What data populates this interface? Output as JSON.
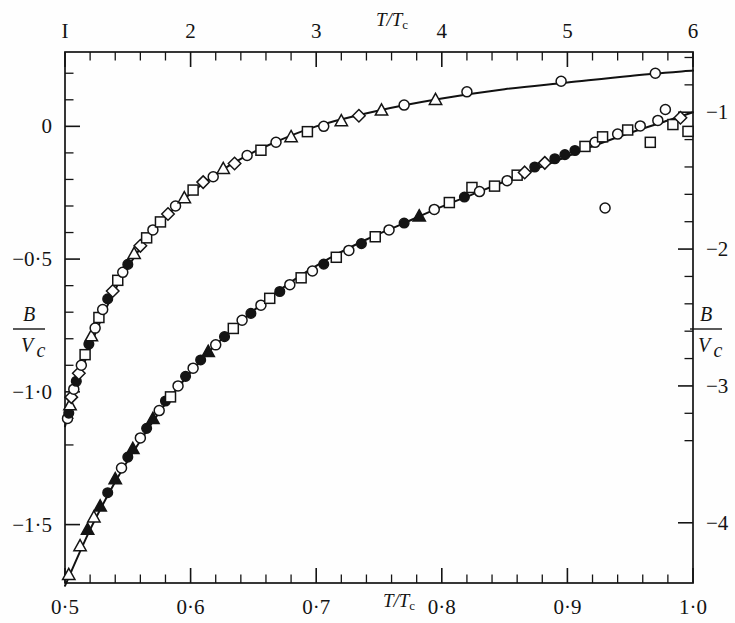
{
  "figure": {
    "background": "#fefefe",
    "ink": "#141414",
    "curve_color": "#111111"
  },
  "chart_data": {
    "type": "scatter",
    "title": "",
    "subtitle": "",
    "grid": false,
    "legend": "none",
    "axes": {
      "top": {
        "name": "top-axis",
        "label": "T/Tc",
        "label_numerator": "T",
        "label_denominator": "T",
        "label_subscript": "c",
        "ticks": [
          "I",
          "2",
          "3",
          "4",
          "5",
          "6"
        ],
        "tick_values": [
          1,
          2,
          3,
          4,
          5,
          6
        ],
        "range": [
          1,
          6
        ],
        "minor_per_major": 5
      },
      "bottom": {
        "name": "bottom-axis",
        "label": "T/Tc",
        "label_numerator": "T",
        "label_denominator": "T",
        "label_subscript": "c",
        "ticks": [
          "0·5",
          "0·6",
          "0·7",
          "0·8",
          "0·9",
          "1·0"
        ],
        "tick_values": [
          0.5,
          0.6,
          0.7,
          0.8,
          0.9,
          1.0
        ],
        "range": [
          0.5,
          1.0
        ],
        "minor_per_major": 5
      },
      "left": {
        "name": "left-axis",
        "label": "B/Vc",
        "label_numerator": "B",
        "label_denominator": "V",
        "label_subscript": "c",
        "ticks": [
          "0",
          "−0·5",
          "−1·0",
          "−1·5"
        ],
        "tick_values": [
          0,
          -0.5,
          -1.0,
          -1.5
        ],
        "range": [
          0.28,
          -1.72
        ],
        "minor_per_major": 5
      },
      "right": {
        "name": "right-axis",
        "label": "B/Vc",
        "label_numerator": "B",
        "label_denominator": "V",
        "label_subscript": "c",
        "ticks": [
          "−1",
          "−2",
          "−3",
          "−4"
        ],
        "tick_values": [
          -1,
          -2,
          -3,
          -4
        ],
        "range": [
          -0.56,
          -4.44
        ],
        "minor_per_major": 5
      }
    },
    "series": [
      {
        "name": "upper-curve-high-temperature-branch",
        "axis_x": "top",
        "axis_y": "left",
        "line": true,
        "points": [
          {
            "x": 1.02,
            "y": -1.1,
            "marker": "circle-open"
          },
          {
            "x": 1.03,
            "y": -1.08,
            "marker": "circle-filled"
          },
          {
            "x": 1.04,
            "y": -1.05,
            "marker": "triangle-open"
          },
          {
            "x": 1.05,
            "y": -1.02,
            "marker": "diamond-open"
          },
          {
            "x": 1.07,
            "y": -0.99,
            "marker": "circle-open"
          },
          {
            "x": 1.09,
            "y": -0.96,
            "marker": "circle-filled"
          },
          {
            "x": 1.11,
            "y": -0.93,
            "marker": "diamond-open"
          },
          {
            "x": 1.13,
            "y": -0.9,
            "marker": "circle-open"
          },
          {
            "x": 1.16,
            "y": -0.86,
            "marker": "square-open"
          },
          {
            "x": 1.19,
            "y": -0.82,
            "marker": "circle-filled"
          },
          {
            "x": 1.21,
            "y": -0.79,
            "marker": "triangle-open"
          },
          {
            "x": 1.24,
            "y": -0.76,
            "marker": "circle-open"
          },
          {
            "x": 1.27,
            "y": -0.72,
            "marker": "square-open"
          },
          {
            "x": 1.3,
            "y": -0.69,
            "marker": "circle-open"
          },
          {
            "x": 1.34,
            "y": -0.65,
            "marker": "circle-filled"
          },
          {
            "x": 1.38,
            "y": -0.62,
            "marker": "diamond-open"
          },
          {
            "x": 1.42,
            "y": -0.58,
            "marker": "square-open"
          },
          {
            "x": 1.46,
            "y": -0.55,
            "marker": "circle-open"
          },
          {
            "x": 1.5,
            "y": -0.52,
            "marker": "circle-filled"
          },
          {
            "x": 1.55,
            "y": -0.48,
            "marker": "triangle-open"
          },
          {
            "x": 1.6,
            "y": -0.45,
            "marker": "diamond-open"
          },
          {
            "x": 1.65,
            "y": -0.42,
            "marker": "square-open"
          },
          {
            "x": 1.7,
            "y": -0.39,
            "marker": "circle-open"
          },
          {
            "x": 1.76,
            "y": -0.36,
            "marker": "square-open"
          },
          {
            "x": 1.82,
            "y": -0.33,
            "marker": "diamond-open"
          },
          {
            "x": 1.88,
            "y": -0.3,
            "marker": "circle-open"
          },
          {
            "x": 1.95,
            "y": -0.27,
            "marker": "triangle-open"
          },
          {
            "x": 2.02,
            "y": -0.24,
            "marker": "square-open"
          },
          {
            "x": 2.1,
            "y": -0.21,
            "marker": "diamond-open"
          },
          {
            "x": 2.18,
            "y": -0.19,
            "marker": "circle-open"
          },
          {
            "x": 2.26,
            "y": -0.16,
            "marker": "triangle-open"
          },
          {
            "x": 2.35,
            "y": -0.14,
            "marker": "diamond-open"
          },
          {
            "x": 2.45,
            "y": -0.11,
            "marker": "circle-open"
          },
          {
            "x": 2.56,
            "y": -0.09,
            "marker": "square-open"
          },
          {
            "x": 2.68,
            "y": -0.06,
            "marker": "circle-open"
          },
          {
            "x": 2.8,
            "y": -0.04,
            "marker": "triangle-open"
          },
          {
            "x": 2.93,
            "y": -0.02,
            "marker": "square-open"
          },
          {
            "x": 3.06,
            "y": 0.0,
            "marker": "circle-open"
          },
          {
            "x": 3.2,
            "y": 0.02,
            "marker": "triangle-open"
          },
          {
            "x": 3.34,
            "y": 0.04,
            "marker": "diamond-open"
          },
          {
            "x": 3.52,
            "y": 0.06,
            "marker": "triangle-open"
          },
          {
            "x": 3.7,
            "y": 0.08,
            "marker": "circle-open"
          },
          {
            "x": 3.95,
            "y": 0.1,
            "marker": "triangle-open"
          },
          {
            "x": 4.2,
            "y": 0.13,
            "marker": "circle-open"
          },
          {
            "x": 4.95,
            "y": 0.17,
            "marker": "circle-open"
          },
          {
            "x": 5.7,
            "y": 0.2,
            "marker": "circle-open"
          }
        ]
      },
      {
        "name": "lower-curve-low-temperature-branch",
        "axis_x": "bottom",
        "axis_y": "right",
        "line": true,
        "points": [
          {
            "x": 0.503,
            "y": -4.38,
            "marker": "triangle-open"
          },
          {
            "x": 0.512,
            "y": -4.17,
            "marker": "triangle-open"
          },
          {
            "x": 0.518,
            "y": -4.05,
            "marker": "triangle-filled"
          },
          {
            "x": 0.523,
            "y": -3.96,
            "marker": "triangle-open"
          },
          {
            "x": 0.528,
            "y": -3.88,
            "marker": "triangle-filled"
          },
          {
            "x": 0.534,
            "y": -3.78,
            "marker": "circle-filled"
          },
          {
            "x": 0.54,
            "y": -3.68,
            "marker": "triangle-filled"
          },
          {
            "x": 0.545,
            "y": -3.6,
            "marker": "circle-open"
          },
          {
            "x": 0.55,
            "y": -3.52,
            "marker": "circle-filled"
          },
          {
            "x": 0.554,
            "y": -3.46,
            "marker": "triangle-filled"
          },
          {
            "x": 0.56,
            "y": -3.38,
            "marker": "circle-open"
          },
          {
            "x": 0.565,
            "y": -3.31,
            "marker": "circle-filled"
          },
          {
            "x": 0.57,
            "y": -3.24,
            "marker": "triangle-filled"
          },
          {
            "x": 0.575,
            "y": -3.18,
            "marker": "circle-open"
          },
          {
            "x": 0.58,
            "y": -3.11,
            "marker": "circle-filled"
          },
          {
            "x": 0.584,
            "y": -3.08,
            "marker": "square-open"
          },
          {
            "x": 0.59,
            "y": -3.0,
            "marker": "circle-open"
          },
          {
            "x": 0.596,
            "y": -2.93,
            "marker": "circle-filled"
          },
          {
            "x": 0.602,
            "y": -2.87,
            "marker": "circle-open"
          },
          {
            "x": 0.608,
            "y": -2.81,
            "marker": "circle-filled"
          },
          {
            "x": 0.614,
            "y": -2.75,
            "marker": "triangle-filled"
          },
          {
            "x": 0.62,
            "y": -2.7,
            "marker": "circle-open"
          },
          {
            "x": 0.627,
            "y": -2.64,
            "marker": "circle-filled"
          },
          {
            "x": 0.634,
            "y": -2.58,
            "marker": "square-open"
          },
          {
            "x": 0.641,
            "y": -2.52,
            "marker": "circle-open"
          },
          {
            "x": 0.648,
            "y": -2.47,
            "marker": "circle-filled"
          },
          {
            "x": 0.656,
            "y": -2.41,
            "marker": "circle-open"
          },
          {
            "x": 0.663,
            "y": -2.36,
            "marker": "square-open"
          },
          {
            "x": 0.671,
            "y": -2.31,
            "marker": "circle-filled"
          },
          {
            "x": 0.679,
            "y": -2.26,
            "marker": "circle-open"
          },
          {
            "x": 0.688,
            "y": -2.21,
            "marker": "square-open"
          },
          {
            "x": 0.697,
            "y": -2.16,
            "marker": "circle-open"
          },
          {
            "x": 0.706,
            "y": -2.11,
            "marker": "circle-filled"
          },
          {
            "x": 0.716,
            "y": -2.06,
            "marker": "square-open"
          },
          {
            "x": 0.726,
            "y": -2.01,
            "marker": "circle-open"
          },
          {
            "x": 0.736,
            "y": -1.96,
            "marker": "circle-filled"
          },
          {
            "x": 0.747,
            "y": -1.91,
            "marker": "square-open"
          },
          {
            "x": 0.758,
            "y": -1.86,
            "marker": "circle-open"
          },
          {
            "x": 0.77,
            "y": -1.81,
            "marker": "circle-filled"
          },
          {
            "x": 0.782,
            "y": -1.76,
            "marker": "triangle-filled"
          },
          {
            "x": 0.794,
            "y": -1.71,
            "marker": "circle-open"
          },
          {
            "x": 0.806,
            "y": -1.66,
            "marker": "square-open"
          },
          {
            "x": 0.818,
            "y": -1.62,
            "marker": "circle-filled"
          },
          {
            "x": 0.824,
            "y": -1.55,
            "marker": "square-open"
          },
          {
            "x": 0.83,
            "y": -1.58,
            "marker": "circle-open"
          },
          {
            "x": 0.842,
            "y": -1.54,
            "marker": "square-open"
          },
          {
            "x": 0.852,
            "y": -1.5,
            "marker": "circle-open"
          },
          {
            "x": 0.86,
            "y": -1.46,
            "marker": "square-open"
          },
          {
            "x": 0.866,
            "y": -1.44,
            "marker": "diamond-open"
          },
          {
            "x": 0.874,
            "y": -1.4,
            "marker": "circle-filled"
          },
          {
            "x": 0.882,
            "y": -1.37,
            "marker": "diamond-open"
          },
          {
            "x": 0.89,
            "y": -1.34,
            "marker": "circle-filled"
          },
          {
            "x": 0.898,
            "y": -1.31,
            "marker": "circle-filled"
          },
          {
            "x": 0.906,
            "y": -1.28,
            "marker": "circle-filled"
          },
          {
            "x": 0.914,
            "y": -1.25,
            "marker": "square-open"
          },
          {
            "x": 0.922,
            "y": -1.22,
            "marker": "circle-open"
          },
          {
            "x": 0.928,
            "y": -1.18,
            "marker": "square-open"
          },
          {
            "x": 0.93,
            "y": -1.7,
            "marker": "circle-open"
          },
          {
            "x": 0.94,
            "y": -1.16,
            "marker": "circle-open"
          },
          {
            "x": 0.948,
            "y": -1.13,
            "marker": "square-open"
          },
          {
            "x": 0.958,
            "y": -1.1,
            "marker": "circle-open"
          },
          {
            "x": 0.966,
            "y": -1.22,
            "marker": "square-open"
          },
          {
            "x": 0.972,
            "y": -1.06,
            "marker": "circle-open"
          },
          {
            "x": 0.978,
            "y": -0.98,
            "marker": "circle-open"
          },
          {
            "x": 0.984,
            "y": -1.09,
            "marker": "square-open"
          },
          {
            "x": 0.99,
            "y": -1.04,
            "marker": "diamond-open"
          },
          {
            "x": 0.996,
            "y": -1.14,
            "marker": "square-open"
          }
        ]
      }
    ],
    "upper_curve_fit": [
      {
        "x": 1.0,
        "y": -1.13
      },
      {
        "x": 1.1,
        "y": -0.97
      },
      {
        "x": 1.2,
        "y": -0.83
      },
      {
        "x": 1.3,
        "y": -0.715
      },
      {
        "x": 1.4,
        "y": -0.615
      },
      {
        "x": 1.5,
        "y": -0.53
      },
      {
        "x": 1.7,
        "y": -0.395
      },
      {
        "x": 1.9,
        "y": -0.295
      },
      {
        "x": 2.1,
        "y": -0.215
      },
      {
        "x": 2.3,
        "y": -0.15
      },
      {
        "x": 2.6,
        "y": -0.075
      },
      {
        "x": 3.0,
        "y": 0.0
      },
      {
        "x": 3.5,
        "y": 0.06
      },
      {
        "x": 4.0,
        "y": 0.105
      },
      {
        "x": 4.5,
        "y": 0.14
      },
      {
        "x": 5.0,
        "y": 0.165
      },
      {
        "x": 5.5,
        "y": 0.19
      },
      {
        "x": 6.0,
        "y": 0.21
      }
    ],
    "lower_curve_fit": [
      {
        "x": 0.5,
        "y": -4.46
      },
      {
        "x": 0.52,
        "y": -4.05
      },
      {
        "x": 0.54,
        "y": -3.7
      },
      {
        "x": 0.56,
        "y": -3.4
      },
      {
        "x": 0.58,
        "y": -3.13
      },
      {
        "x": 0.6,
        "y": -2.9
      },
      {
        "x": 0.62,
        "y": -2.7
      },
      {
        "x": 0.65,
        "y": -2.45
      },
      {
        "x": 0.68,
        "y": -2.24
      },
      {
        "x": 0.71,
        "y": -2.07
      },
      {
        "x": 0.74,
        "y": -1.93
      },
      {
        "x": 0.77,
        "y": -1.81
      },
      {
        "x": 0.8,
        "y": -1.69
      },
      {
        "x": 0.83,
        "y": -1.58
      },
      {
        "x": 0.86,
        "y": -1.47
      },
      {
        "x": 0.89,
        "y": -1.36
      },
      {
        "x": 0.92,
        "y": -1.25
      },
      {
        "x": 0.95,
        "y": -1.15
      },
      {
        "x": 0.98,
        "y": -1.06
      },
      {
        "x": 1.0,
        "y": -1.0
      }
    ]
  }
}
